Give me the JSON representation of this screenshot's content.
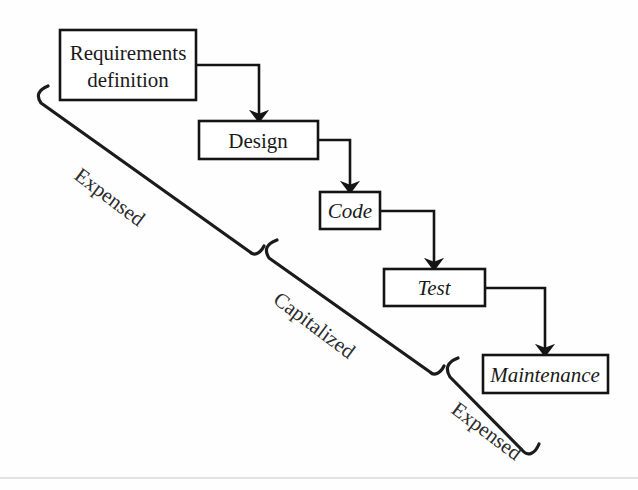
{
  "diagram": {
    "background_color": "#fefefe",
    "line_color": "#141414",
    "text_color": "#1a1a1a",
    "stages": [
      {
        "id": "requirements",
        "label_line1": "Requirements",
        "label_line2": "definition",
        "style": "roman",
        "x": 60,
        "y": 30,
        "w": 136,
        "h": 70,
        "font_size": 21
      },
      {
        "id": "design",
        "label_line1": "Design",
        "label_line2": "",
        "style": "roman",
        "x": 199,
        "y": 121,
        "w": 119,
        "h": 38,
        "font_size": 21
      },
      {
        "id": "code",
        "label_line1": "Code",
        "label_line2": "",
        "style": "italic",
        "x": 320,
        "y": 192,
        "w": 60,
        "h": 37,
        "font_size": 21
      },
      {
        "id": "test",
        "label_line1": "Test",
        "label_line2": "",
        "style": "italic",
        "x": 384,
        "y": 269,
        "w": 101,
        "h": 37,
        "font_size": 21
      },
      {
        "id": "maintenance",
        "label_line1": "Maintenance",
        "label_line2": "",
        "style": "italic",
        "x": 483,
        "y": 355,
        "w": 125,
        "h": 38,
        "font_size": 21
      }
    ],
    "connectors": [
      {
        "id": "requirements-to-design",
        "from": "requirements",
        "to": "design",
        "path": "M 196 65 L 259 65 L 259 116",
        "arrow_at": [
          259,
          121
        ]
      },
      {
        "id": "design-to-code",
        "from": "design",
        "to": "code",
        "path": "M 318 140 L 350 140 L 350 187",
        "arrow_at": [
          350,
          192
        ]
      },
      {
        "id": "code-to-test",
        "from": "code",
        "to": "test",
        "path": "M 380 211 L 434 211 L 434 264",
        "arrow_at": [
          434,
          269
        ]
      },
      {
        "id": "test-to-maintenance",
        "from": "test",
        "to": "maintenance",
        "path": "M 485 288 L 545 288 L 545 350",
        "arrow_at": [
          545,
          355
        ]
      }
    ],
    "braces": [
      {
        "id": "brace-expensed-upper",
        "label": "Expensed",
        "label_x": 73,
        "label_y": 178,
        "rotation": 37,
        "path": "M 48 86 C 38 90 36 96 41 103 L 250 252 C 254 256 260 254 264 246"
      },
      {
        "id": "brace-capitalized",
        "label": "Capitalized",
        "label_x": 272,
        "label_y": 302,
        "rotation": 37,
        "path": "M 277 240 C 266 244 264 250 269 258 L 430 372 C 434 376 440 374 444 366"
      },
      {
        "id": "brace-expensed-lower",
        "label": "Expensed",
        "label_x": 450,
        "label_y": 412,
        "rotation": 37,
        "path": "M 458 358 C 447 362 445 369 450 377 L 524 452 C 528 456 535 454 539 444"
      }
    ],
    "artifact": {
      "id": "page-scan-line",
      "visible": true,
      "y": 478
    }
  }
}
